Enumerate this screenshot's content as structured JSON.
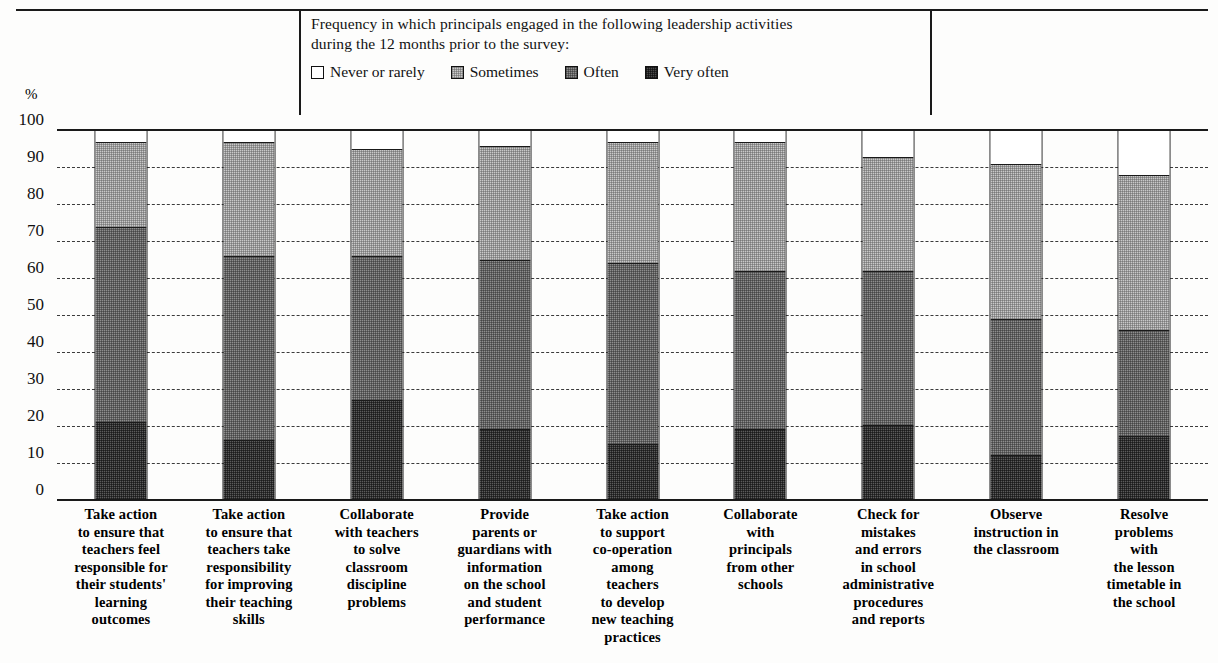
{
  "legend": {
    "caption": "Frequency in which principals engaged in the following leadership activities\nduring the 12 months prior to the survey:",
    "items": [
      {
        "label": "Never or rarely",
        "key": "never",
        "color": "#ffffff"
      },
      {
        "label": "Sometimes",
        "key": "sometimes",
        "color": "#c9c9c9"
      },
      {
        "label": "Often",
        "key": "often",
        "color": "#8e8e8e"
      },
      {
        "label": "Very often",
        "key": "veryoften",
        "color": "#5b5b5b"
      }
    ]
  },
  "axis": {
    "unit_symbol": "%",
    "ticks": [
      "100",
      "90",
      "80",
      "70",
      "60",
      "50",
      "40",
      "30",
      "20",
      "10",
      "0"
    ]
  },
  "chart_data": {
    "type": "bar",
    "title": "",
    "subtitle": "Frequency in which principals engaged in the following leadership activities during the 12 months prior to the survey:",
    "xlabel": "",
    "ylabel": "%",
    "ylim": [
      0,
      100
    ],
    "grid": true,
    "stacked": true,
    "stack_total": 100,
    "legend_position": "top-center",
    "tick_values": [
      0,
      10,
      20,
      30,
      40,
      50,
      60,
      70,
      80,
      90,
      100
    ],
    "categories": [
      "Take action\nto ensure that\nteachers feel\nresponsible for\ntheir students'\nlearning\noutcomes",
      "Take action\nto ensure that\nteachers take\nresponsibility\nfor improving\ntheir teaching\nskills",
      "Collaborate\nwith teachers\nto solve\nclassroom\ndiscipline\nproblems",
      "Provide\nparents or\nguardians with\ninformation\non the school\nand student\nperformance",
      "Take action\nto support\nco-operation\namong\nteachers\nto develop\nnew teaching\npractices",
      "Collaborate\nwith\nprincipals\nfrom other\nschools",
      "Check for\nmistakes\nand errors\nin school\nadministrative\nprocedures\nand reports",
      "Observe\ninstruction in\nthe classroom",
      "Resolve\nproblems\nwith\nthe lesson\ntimetable in\nthe school"
    ],
    "series": [
      {
        "name": "Very often",
        "key": "veryoften",
        "values": [
          21,
          16,
          27,
          19,
          15,
          19,
          20,
          12,
          17
        ]
      },
      {
        "name": "Often",
        "key": "often",
        "values": [
          53,
          50,
          39,
          46,
          49,
          43,
          42,
          37,
          29
        ]
      },
      {
        "name": "Sometimes",
        "key": "sometimes",
        "values": [
          23,
          31,
          29,
          31,
          33,
          35,
          31,
          42,
          42
        ]
      },
      {
        "name": "Never or rarely",
        "key": "never",
        "values": [
          3,
          3,
          5,
          4,
          3,
          3,
          7,
          9,
          12
        ]
      }
    ],
    "cumulative_tops": {
      "veryoften": [
        21,
        16,
        27,
        19,
        15,
        19,
        20,
        12,
        17
      ],
      "often": [
        74,
        66,
        66,
        65,
        64,
        62,
        62,
        49,
        46
      ],
      "sometimes": [
        97,
        97,
        95,
        96,
        97,
        97,
        93,
        91,
        88
      ],
      "never": [
        100,
        100,
        100,
        100,
        100,
        100,
        100,
        100,
        100
      ]
    }
  }
}
